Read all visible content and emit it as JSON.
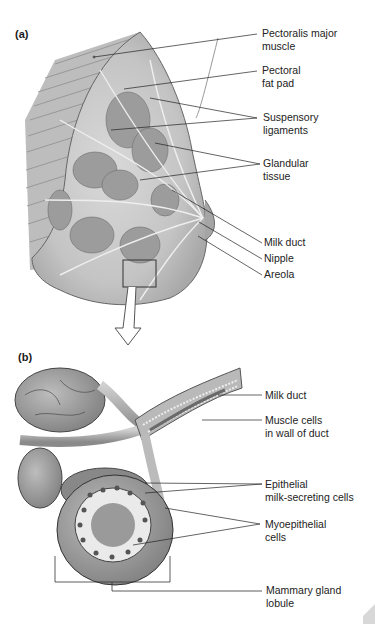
{
  "panel_a": {
    "label": "(a)",
    "labels": [
      {
        "id": "pectoralis",
        "text": "Pectoralis major\nmuscle"
      },
      {
        "id": "fatpad",
        "text": "Pectoral\nfat pad"
      },
      {
        "id": "suspensory",
        "text": "Suspensory\nligaments"
      },
      {
        "id": "glandular",
        "text": "Glandular\ntissue"
      },
      {
        "id": "milkduct",
        "text": "Milk duct"
      },
      {
        "id": "nipple",
        "text": "Nipple"
      },
      {
        "id": "areola",
        "text": "Areola"
      }
    ]
  },
  "panel_b": {
    "label": "(b)",
    "labels": [
      {
        "id": "milkduct",
        "text": "Milk duct"
      },
      {
        "id": "muscle",
        "text": "Muscle cells\nin wall of duct"
      },
      {
        "id": "epithelial",
        "text": "Epithelial\nmilk-secreting cells"
      },
      {
        "id": "myoepithelial",
        "text": "Myoepithelial\ncells"
      },
      {
        "id": "lobule",
        "text": "Mammary gland\nlobule"
      }
    ]
  }
}
